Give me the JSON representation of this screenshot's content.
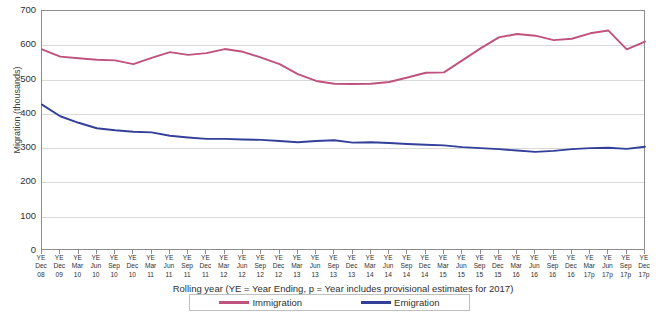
{
  "chart_data": {
    "type": "line",
    "title": "",
    "xlabel": "Rolling year (YE = Year Ending, p = Year includes provisional  estimates for  2017)",
    "ylabel": "Migration (thousands)",
    "ylim": [
      0,
      700
    ],
    "ytick_values": [
      0,
      100,
      200,
      300,
      400,
      500,
      600,
      700
    ],
    "ytick_labels": [
      "0",
      "100",
      "200",
      "300",
      "400",
      "500",
      "600",
      "700"
    ],
    "grid": true,
    "legend_position": "bottom",
    "categories": [
      "YE Dec 08",
      "YE Dec 09",
      "YE Mar 10",
      "YE Jun 10",
      "YE Sep 10",
      "YE Dec 10",
      "YE Mar 11",
      "YE Jun 11",
      "YE Sep 11",
      "YE Dec 11",
      "YE Mar 12",
      "YE Jun 12",
      "YE Sep 12",
      "YE Dec 12",
      "YE Mar 13",
      "YE Jun 13",
      "YE Sep 13",
      "YE Dec 13",
      "YE Mar 14",
      "YE Jun 14",
      "YE Sep 14",
      "YE Dec 14",
      "YE Mar 15",
      "YE Jun 15",
      "YE Sep 15",
      "YE Dec 15",
      "YE Mar 16",
      "YE Jun 16",
      "YE Sep 16",
      "YE Dec 16",
      "YE Mar 17p",
      "YE Jun 17p",
      "YE Sep 17p",
      "YE Dec 17p"
    ],
    "category_lines": [
      [
        "YE",
        "Dec",
        "08"
      ],
      [
        "YE",
        "Dec",
        "09"
      ],
      [
        "YE",
        "Mar",
        "10"
      ],
      [
        "YE",
        "Jun",
        "10"
      ],
      [
        "YE",
        "Sep",
        "10"
      ],
      [
        "YE",
        "Dec",
        "10"
      ],
      [
        "YE",
        "Mar",
        "11"
      ],
      [
        "YE",
        "Jun",
        "11"
      ],
      [
        "YE",
        "Sep",
        "11"
      ],
      [
        "YE",
        "Dec",
        "11"
      ],
      [
        "YE",
        "Mar",
        "12"
      ],
      [
        "YE",
        "Jun",
        "12"
      ],
      [
        "YE",
        "Sep",
        "12"
      ],
      [
        "YE",
        "Dec",
        "12"
      ],
      [
        "YE",
        "Mar",
        "13"
      ],
      [
        "YE",
        "Jun",
        "13"
      ],
      [
        "YE",
        "Sep",
        "13"
      ],
      [
        "YE",
        "Dec",
        "13"
      ],
      [
        "YE",
        "Mar",
        "14"
      ],
      [
        "YE",
        "Jun",
        "14"
      ],
      [
        "YE",
        "Sep",
        "14"
      ],
      [
        "YE",
        "Dec",
        "14"
      ],
      [
        "YE",
        "Mar",
        "15"
      ],
      [
        "YE",
        "Jun",
        "15"
      ],
      [
        "YE",
        "Sep",
        "15"
      ],
      [
        "YE",
        "Dec",
        "15"
      ],
      [
        "YE",
        "Mar",
        "16"
      ],
      [
        "YE",
        "Jun",
        "16"
      ],
      [
        "YE",
        "Sep",
        "16"
      ],
      [
        "YE",
        "Dec",
        "16"
      ],
      [
        "YE",
        "Mar",
        "17p"
      ],
      [
        "YE",
        "Jun",
        "17p"
      ],
      [
        "YE",
        "Sep",
        "17p"
      ],
      [
        "YE",
        "Dec",
        "17p"
      ]
    ],
    "series": [
      {
        "name": "Immigration",
        "color": "#c0527e",
        "values": [
          588,
          567,
          562,
          558,
          556,
          545,
          563,
          580,
          572,
          577,
          589,
          581,
          564,
          545,
          516,
          496,
          488,
          487,
          488,
          493,
          506,
          520,
          521,
          556,
          591,
          623,
          633,
          628,
          615,
          619,
          635,
          643,
          588,
          611
        ]
      },
      {
        "name": "Emigration",
        "color": "#32409a",
        "values": [
          427,
          393,
          374,
          358,
          352,
          348,
          346,
          336,
          331,
          327,
          327,
          325,
          324,
          321,
          317,
          321,
          323,
          316,
          317,
          315,
          312,
          310,
          308,
          303,
          300,
          297,
          293,
          289,
          292,
          297,
          300,
          301,
          298,
          304
        ]
      }
    ]
  },
  "legend": {
    "items": [
      {
        "label": "Immigration",
        "color": "#c0527e"
      },
      {
        "label": "Emigration",
        "color": "#32409a"
      }
    ]
  }
}
